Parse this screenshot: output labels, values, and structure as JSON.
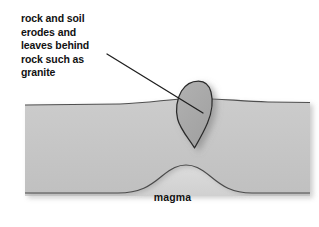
{
  "figure": {
    "width": 319,
    "height": 227,
    "background_color": "#ffffff"
  },
  "annotation": {
    "name": "erosion-annotation",
    "text": "rock and soil\nerodes and\nleaves behind\nrock such as\ngranite",
    "lines": [
      "rock and soil",
      "erodes and",
      "leaves behind",
      "rock such as",
      "granite"
    ],
    "text_color": "#121212",
    "leader_line": {
      "from_x": 107,
      "from_y": 54,
      "to_x": 203,
      "to_y": 113,
      "color": "#1f1f1f"
    }
  },
  "labels": {
    "magma": "magma",
    "magma_color": "#131313"
  },
  "layers": {
    "crust": {
      "name": "crust-layer",
      "fill": "#c6c6c6",
      "outline": "#4a4a4a"
    },
    "magma": {
      "name": "magma-layer",
      "fill": "#d6d6d6",
      "outline": "#4a4a4a"
    },
    "pluton": {
      "name": "granite-pluton",
      "fill": "#a8a8a8",
      "outline": "#2b2b2b",
      "shape": "teardrop",
      "top_y": 81,
      "bottom_y": 148,
      "left_x": 177,
      "right_x": 212
    }
  }
}
